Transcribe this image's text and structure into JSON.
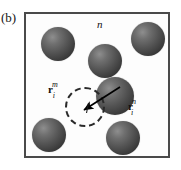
{
  "figure": {
    "panel_label": "(b)",
    "width": 181,
    "height": 170,
    "background_color": "#ffffff"
  },
  "frame": {
    "name": "simulation-cell",
    "border_color": "#4a4a4a",
    "fill_color": "#fdfdfd",
    "x": 24,
    "y": 12,
    "width": 146,
    "height": 146
  },
  "labels": {
    "configuration_n": "n",
    "vector_m": {
      "symbol": "r",
      "superscript": "m",
      "subscript": "i"
    },
    "vector_n": {
      "symbol": "r",
      "superscript": "n",
      "subscript": "i"
    }
  },
  "spheres": {
    "name": "particle",
    "color_light": "#8e8e8e",
    "color_dark": "#232323",
    "count": 6,
    "items": [
      {
        "id": "particle-top-left",
        "cx": 58,
        "cy": 44,
        "r": 17
      },
      {
        "id": "particle-top-right",
        "cx": 148,
        "cy": 39,
        "r": 17
      },
      {
        "id": "particle-upper-middle",
        "cx": 105,
        "cy": 61,
        "r": 17
      },
      {
        "id": "particle-center",
        "cx": 115,
        "cy": 96,
        "r": 19
      },
      {
        "id": "particle-bottom-left",
        "cx": 49,
        "cy": 135,
        "r": 17
      },
      {
        "id": "particle-bottom-right",
        "cx": 123,
        "cy": 138,
        "r": 17
      }
    ]
  },
  "dashed_circle": {
    "name": "reference-position-circle",
    "cx": 85,
    "cy": 107,
    "r": 20,
    "stroke_color": "#2a2a2a",
    "style": "dashed"
  },
  "arrow": {
    "name": "displacement-vector",
    "x1": 119,
    "y1": 88,
    "x2": 83,
    "y2": 110,
    "color": "#000000"
  },
  "tick": {
    "name": "center-tick-mark",
    "x1": 88,
    "y1": 104,
    "x2": 86,
    "y2": 114,
    "color": "#1a1a1a"
  }
}
